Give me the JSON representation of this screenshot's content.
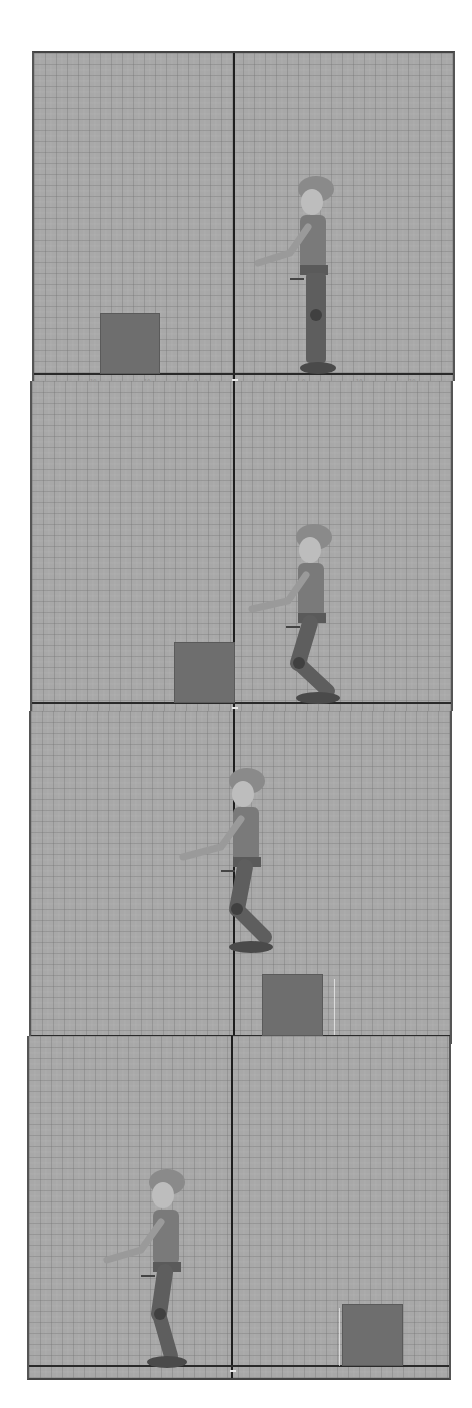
{
  "viewport": {
    "title": "Animation sequence – side view",
    "colors": {
      "background": "#a8a8a8",
      "grid_line": "#787878",
      "axis_line": "#1e1e1e",
      "box_fill": "#6e6e6e",
      "character_body": "#6a6a6a",
      "character_skin": "#bdbdbd",
      "character_cap": "#8a8a8a",
      "page_background": "#ffffff"
    },
    "ruler_tick_labels": [
      "10",
      "10",
      "0",
      "0",
      "10",
      "10"
    ],
    "frames": [
      {
        "index": 1,
        "label": "Frame 1",
        "character_pose": "standing",
        "character_side": "right",
        "box_position": "left",
        "box_on_ground": true
      },
      {
        "index": 2,
        "label": "Frame 2",
        "character_pose": "crouch",
        "character_side": "right",
        "box_position": "center-left",
        "box_on_ground": true
      },
      {
        "index": 3,
        "label": "Frame 3",
        "character_pose": "jump-airborne",
        "character_side": "center",
        "box_position": "center-right",
        "box_on_ground": true
      },
      {
        "index": 4,
        "label": "Frame 4",
        "character_pose": "landed",
        "character_side": "left",
        "box_position": "right",
        "box_on_ground": true
      }
    ]
  }
}
